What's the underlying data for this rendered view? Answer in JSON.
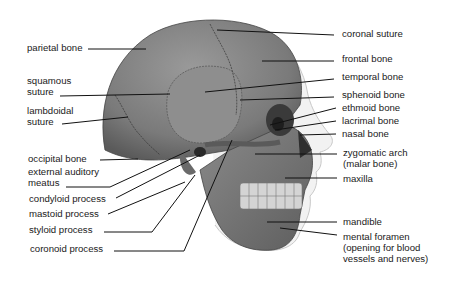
{
  "diagram": {
    "labels_left": [
      {
        "id": "parietal",
        "text": "parietal bone"
      },
      {
        "id": "squamous",
        "text": "squamous\nsuture"
      },
      {
        "id": "lambdoidal",
        "text": "lambdoidal\nsuture"
      },
      {
        "id": "occipital",
        "text": "occipital bone"
      },
      {
        "id": "ext_auditory",
        "text": "external auditory\nmeatus"
      },
      {
        "id": "condyloid",
        "text": "condyloid process"
      },
      {
        "id": "mastoid",
        "text": "mastoid process"
      },
      {
        "id": "styloid",
        "text": "styloid process"
      },
      {
        "id": "coronoid",
        "text": "coronoid process"
      }
    ],
    "labels_right": [
      {
        "id": "coronal",
        "text": "coronal suture"
      },
      {
        "id": "frontal",
        "text": "frontal bone"
      },
      {
        "id": "temporal",
        "text": "temporal bone"
      },
      {
        "id": "sphenoid",
        "text": "sphenoid bone"
      },
      {
        "id": "ethmoid",
        "text": "ethmoid bone"
      },
      {
        "id": "lacrimal",
        "text": "lacrimal bone"
      },
      {
        "id": "nasal",
        "text": "nasal bone"
      },
      {
        "id": "zygomatic",
        "text": "zygomatic arch\n(malar bone)"
      },
      {
        "id": "maxilla",
        "text": "maxilla"
      },
      {
        "id": "mandible",
        "text": "mandible"
      },
      {
        "id": "mental",
        "text": "mental foramen\n(opening for blood\nvessels and nerves)"
      }
    ]
  }
}
